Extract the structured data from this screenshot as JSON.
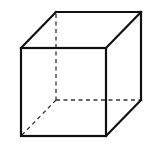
{
  "diagram": {
    "title": "",
    "type": "cube-wireframe",
    "colors": {
      "background": "#ffffff",
      "edge": "#111111",
      "hidden_edge": "#333333"
    },
    "vertices": {
      "front_top_left": [
        21,
        48
      ],
      "front_top_right": [
        106,
        48
      ],
      "front_bottom_left": [
        21,
        136
      ],
      "front_bottom_right": [
        106,
        136
      ],
      "back_top_left": [
        56,
        12
      ],
      "back_top_right": [
        141,
        12
      ],
      "back_bottom_right": [
        141,
        100
      ],
      "back_bottom_left": [
        56,
        100
      ]
    },
    "visible_edges": 9,
    "hidden_edges": 3
  }
}
